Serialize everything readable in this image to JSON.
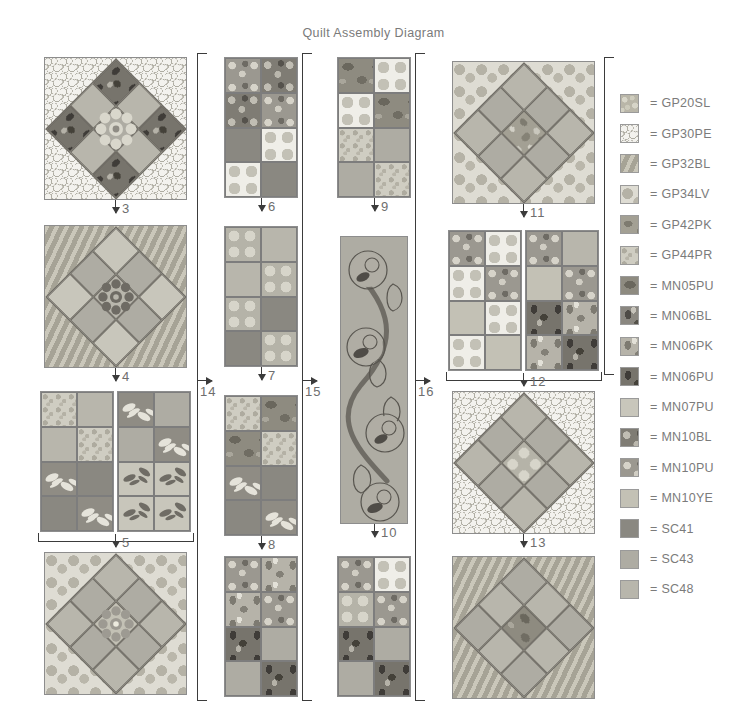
{
  "page": {
    "title": "Quilt Assembly Diagram",
    "width": 747,
    "height": 719
  },
  "legend": {
    "equals": "=",
    "entries": [
      {
        "code": "GP20SL",
        "fabric": "GP20SL",
        "swatch": "mottled-dot-tan"
      },
      {
        "code": "GP30PE",
        "fabric": "GP30PE",
        "swatch": "pebble-outline-white"
      },
      {
        "code": "GP32BL",
        "fabric": "GP32BL",
        "swatch": "diagonal-stripe"
      },
      {
        "code": "GP34LV",
        "fabric": "GP34LV",
        "swatch": "large-spot-pale"
      },
      {
        "code": "GP42PK",
        "fabric": "GP42PK",
        "swatch": "abstract-blotch-dark"
      },
      {
        "code": "GP44PR",
        "fabric": "GP44PR",
        "swatch": "fine-speckle-light"
      },
      {
        "code": "MN05PU",
        "fabric": "MN05PU",
        "swatch": "shaded-leaf-dark"
      },
      {
        "code": "MN06BL",
        "fabric": "MN06BL",
        "swatch": "floral-silhouette-mid"
      },
      {
        "code": "MN06PK",
        "fabric": "MN06PK",
        "swatch": "floral-silhouette-light"
      },
      {
        "code": "MN06PU",
        "fabric": "MN06PU",
        "swatch": "floral-silhouette-dark"
      },
      {
        "code": "MN07PU",
        "fabric": "MN07PU",
        "swatch": "solid-pale"
      },
      {
        "code": "MN10BL",
        "fabric": "MN10BL",
        "swatch": "daisy-dark-ground"
      },
      {
        "code": "MN10PU",
        "fabric": "MN10PU",
        "swatch": "daisy-mid-ground"
      },
      {
        "code": "MN10YE",
        "fabric": "MN10YE",
        "swatch": "solid-light"
      },
      {
        "code": "SC41",
        "fabric": "SC41",
        "swatch": "solid-dark"
      },
      {
        "code": "SC43",
        "fabric": "SC43",
        "swatch": "solid-medium"
      },
      {
        "code": "SC48",
        "fabric": "SC48",
        "swatch": "solid-mid-light"
      }
    ]
  },
  "step_numbers": {
    "s1": "1",
    "s2": "2",
    "s3": "3",
    "s4": "4",
    "s5": "5",
    "s6": "6",
    "s7": "7",
    "s8": "8",
    "s9": "9",
    "s10": "10",
    "s11": "11",
    "s12": "12",
    "s13": "13",
    "s14": "14",
    "s15": "15",
    "s16": "16"
  },
  "columns": {
    "col1": {
      "name": "column-one",
      "join_step": "14",
      "blocks": [
        {
          "id": "block-3",
          "type": "star-on-point",
          "step": "3",
          "background": "GP30PE",
          "star_points": "SC48",
          "center": "SC43",
          "accent": "MN06PU",
          "flower": "light"
        },
        {
          "id": "block-4",
          "type": "star-on-point",
          "step": "4",
          "background": "GP32BL",
          "star_points": "SC43",
          "center": "SC48",
          "accent": "MN07PU",
          "flower": "dark"
        },
        {
          "id": "unit-1a",
          "type": "four-patch-strip",
          "step": "1",
          "patches": [
            "GP44PR",
            "SC48",
            "SC48",
            "GP44PR",
            "MN10BL",
            "SC41",
            "SC41",
            "MN10BL"
          ]
        },
        {
          "id": "unit-1b",
          "type": "four-patch-strip",
          "step": "1",
          "patches": [
            "MN10PU",
            "SC43",
            "SC43",
            "MN10PU",
            "MN10YE",
            "MN10YE",
            "MN06PU",
            "MN10YE"
          ]
        },
        {
          "id": "block-5",
          "type": "star-on-point",
          "step": "5",
          "background": "GP34LV",
          "star_points": "SC43",
          "center": "MN10YE",
          "accent": "SC48",
          "flower": "dark"
        }
      ]
    },
    "col2": {
      "name": "column-two",
      "join_step": "15",
      "blocks": [
        {
          "id": "block-6",
          "type": "four-patch-strip",
          "step": "6",
          "patches": [
            "MN10PU",
            "MN10BL",
            "MN10BL",
            "MN10PU",
            "SC41",
            "GP34LV",
            "GP34LV",
            "SC41"
          ]
        },
        {
          "id": "block-7",
          "type": "four-patch-strip",
          "step": "7",
          "patches": [
            "GP34LV",
            "SC48",
            "SC48",
            "GP34LV",
            "GP34LV",
            "SC41",
            "SC41",
            "GP34LV"
          ]
        },
        {
          "id": "block-8",
          "type": "four-patch-strip",
          "step": "8",
          "patches": [
            "GP44PR",
            "MN05PU",
            "MN05PU",
            "GP44PR",
            "MN10BL",
            "SC41",
            "SC41",
            "MN10BL"
          ]
        },
        {
          "id": "block-17",
          "type": "four-patch-strip",
          "step": "",
          "patches": [
            "MN10PU",
            "MN06PK",
            "MN06PK",
            "MN10PU",
            "MN06PU",
            "SC43",
            "SC43",
            "MN06PU"
          ]
        }
      ]
    },
    "col3": {
      "name": "column-three-centre",
      "join_step": "16",
      "blocks": [
        {
          "id": "block-9",
          "type": "four-patch-strip",
          "step": "9",
          "patches": [
            "MN05PU",
            "GP34LV",
            "GP34LV",
            "MN05PU",
            "GP44PR",
            "SC43",
            "SC43",
            "GP44PR"
          ]
        },
        {
          "id": "panel-10",
          "type": "applique-vine-panel",
          "step": "10",
          "background": "SC43",
          "vine": "SC41",
          "flower_count": 4,
          "leaf_count": 4
        },
        {
          "id": "block-18",
          "type": "four-patch-strip",
          "step": "",
          "patches": [
            "MN10PU",
            "GP34LV",
            "GP34LV",
            "MN10PU",
            "MN06PU",
            "SC43",
            "SC43",
            "MN06PU"
          ]
        }
      ]
    },
    "col4": {
      "name": "column-four",
      "blocks": [
        {
          "id": "block-11",
          "type": "star-on-point",
          "step": "11",
          "background": "GP34LV",
          "star_points": "SC43",
          "center": "GP42PK",
          "accent": "SC48",
          "flower": "none"
        },
        {
          "id": "unit-2a",
          "type": "four-patch-strip",
          "step": "2",
          "patches": [
            "MN10PU",
            "GP34LV",
            "GP34LV",
            "MN10PU",
            "MN10YE",
            "GP34LV",
            "GP34LV",
            "MN10YE"
          ]
        },
        {
          "id": "unit-2b",
          "type": "four-patch-strip",
          "step": "2",
          "patches": [
            "MN10PU",
            "SC48",
            "MN10YE",
            "MN10PU",
            "MN06PU",
            "MN06PK",
            "MN06PK",
            "MN06PU"
          ]
        },
        {
          "id": "block-12",
          "type": "star-on-point",
          "step": "12",
          "background": "GP30PE",
          "star_points": "SC43",
          "center": "GP34LV",
          "accent": "SC48",
          "flower": "none"
        },
        {
          "id": "block-13",
          "type": "star-on-point",
          "step": "13",
          "background": "GP32BL",
          "star_points": "SC48",
          "center": "MN05PU",
          "accent": "SC43",
          "flower": "none"
        }
      ]
    }
  }
}
